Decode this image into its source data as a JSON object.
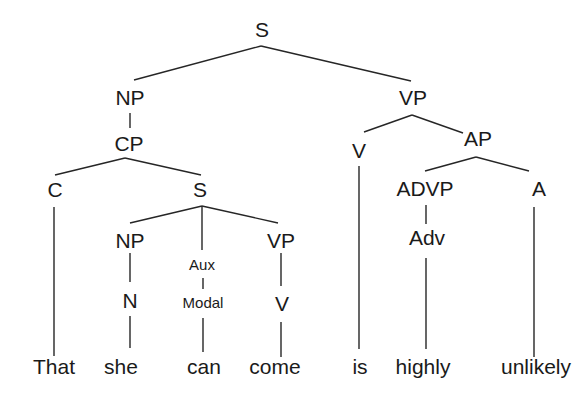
{
  "diagram": {
    "type": "syntax-tree",
    "sentence": "That she can come is highly unlikely",
    "nodes": [
      {
        "id": "s_root",
        "label": "S",
        "x": 262,
        "y": 37,
        "size": "big"
      },
      {
        "id": "np_main",
        "label": "NP",
        "x": 130,
        "y": 105,
        "size": "big"
      },
      {
        "id": "cp",
        "label": "CP",
        "x": 129,
        "y": 151,
        "size": "big"
      },
      {
        "id": "vp_main",
        "label": "VP",
        "x": 413,
        "y": 105,
        "size": "big"
      },
      {
        "id": "v_main",
        "label": "V",
        "x": 359,
        "y": 158,
        "size": "big"
      },
      {
        "id": "ap",
        "label": "AP",
        "x": 478,
        "y": 146,
        "size": "big"
      },
      {
        "id": "c",
        "label": "C",
        "x": 55,
        "y": 197,
        "size": "big"
      },
      {
        "id": "s_sub",
        "label": "S",
        "x": 200,
        "y": 197,
        "size": "big"
      },
      {
        "id": "advp",
        "label": "ADVP",
        "x": 425,
        "y": 196,
        "size": "big"
      },
      {
        "id": "a",
        "label": "A",
        "x": 539,
        "y": 196,
        "size": "big"
      },
      {
        "id": "np_sub",
        "label": "NP",
        "x": 130,
        "y": 248,
        "size": "big"
      },
      {
        "id": "aux",
        "label": "Aux",
        "x": 202,
        "y": 270,
        "size": "small"
      },
      {
        "id": "vp_sub",
        "label": "VP",
        "x": 281,
        "y": 248,
        "size": "big"
      },
      {
        "id": "adv",
        "label": "Adv",
        "x": 427,
        "y": 245,
        "size": "big"
      },
      {
        "id": "n",
        "label": "N",
        "x": 130,
        "y": 308,
        "size": "big"
      },
      {
        "id": "modal",
        "label": "Modal",
        "x": 203,
        "y": 308,
        "size": "small"
      },
      {
        "id": "v_sub",
        "label": "V",
        "x": 282,
        "y": 311,
        "size": "big"
      }
    ],
    "words": [
      {
        "id": "w_that",
        "label": "That",
        "x": 54,
        "y": 374
      },
      {
        "id": "w_she",
        "label": "she",
        "x": 121,
        "y": 374
      },
      {
        "id": "w_can",
        "label": "can",
        "x": 204,
        "y": 374
      },
      {
        "id": "w_come",
        "label": "come",
        "x": 275,
        "y": 374
      },
      {
        "id": "w_is",
        "label": "is",
        "x": 360,
        "y": 374
      },
      {
        "id": "w_highly",
        "label": "highly",
        "x": 423,
        "y": 374
      },
      {
        "id": "w_unlikely",
        "label": "unlikely",
        "x": 536,
        "y": 374
      }
    ],
    "edges": [
      {
        "from": "s_root",
        "to": "np_main",
        "x1": 261,
        "y1": 46,
        "x2": 134,
        "y2": 80
      },
      {
        "from": "s_root",
        "to": "vp_main",
        "x1": 261,
        "y1": 46,
        "x2": 411,
        "y2": 81
      },
      {
        "from": "np_main",
        "to": "cp",
        "x1": 130,
        "y1": 113,
        "x2": 130,
        "y2": 128
      },
      {
        "from": "cp",
        "to": "c",
        "x1": 125,
        "y1": 158,
        "x2": 55,
        "y2": 175
      },
      {
        "from": "cp",
        "to": "s_sub",
        "x1": 125,
        "y1": 158,
        "x2": 201,
        "y2": 175
      },
      {
        "from": "vp_main",
        "to": "v_main",
        "x1": 412,
        "y1": 115,
        "x2": 364,
        "y2": 132
      },
      {
        "from": "vp_main",
        "to": "ap",
        "x1": 412,
        "y1": 115,
        "x2": 463,
        "y2": 133
      },
      {
        "from": "ap",
        "to": "advp",
        "x1": 476,
        "y1": 157,
        "x2": 425,
        "y2": 171
      },
      {
        "from": "ap",
        "to": "a",
        "x1": 476,
        "y1": 157,
        "x2": 529,
        "y2": 171
      },
      {
        "from": "s_sub",
        "to": "np_sub",
        "x1": 202,
        "y1": 206,
        "x2": 130,
        "y2": 223
      },
      {
        "from": "s_sub",
        "to": "aux",
        "x1": 202,
        "y1": 206,
        "x2": 202,
        "y2": 250
      },
      {
        "from": "s_sub",
        "to": "vp_sub",
        "x1": 202,
        "y1": 206,
        "x2": 278,
        "y2": 223
      },
      {
        "from": "np_sub",
        "to": "n",
        "x1": 130,
        "y1": 253,
        "x2": 130,
        "y2": 282
      },
      {
        "from": "aux",
        "to": "modal",
        "x1": 203,
        "y1": 278,
        "x2": 203,
        "y2": 289
      },
      {
        "from": "vp_sub",
        "to": "v_sub",
        "x1": 281,
        "y1": 253,
        "x2": 281,
        "y2": 286
      },
      {
        "from": "advp",
        "to": "adv",
        "x1": 426,
        "y1": 205,
        "x2": 426,
        "y2": 224
      },
      {
        "from": "c",
        "to": "w_that",
        "x1": 54,
        "y1": 207,
        "x2": 54,
        "y2": 356
      },
      {
        "from": "n",
        "to": "w_she",
        "x1": 130,
        "y1": 316,
        "x2": 130,
        "y2": 348
      },
      {
        "from": "modal",
        "to": "w_can",
        "x1": 203,
        "y1": 318,
        "x2": 203,
        "y2": 352
      },
      {
        "from": "v_sub",
        "to": "w_come",
        "x1": 281,
        "y1": 322,
        "x2": 281,
        "y2": 357
      },
      {
        "from": "v_main",
        "to": "w_is",
        "x1": 359,
        "y1": 166,
        "x2": 359,
        "y2": 349
      },
      {
        "from": "adv",
        "to": "w_highly",
        "x1": 426,
        "y1": 258,
        "x2": 426,
        "y2": 349
      },
      {
        "from": "a",
        "to": "w_unlikely",
        "x1": 534,
        "y1": 207,
        "x2": 534,
        "y2": 357
      }
    ]
  }
}
